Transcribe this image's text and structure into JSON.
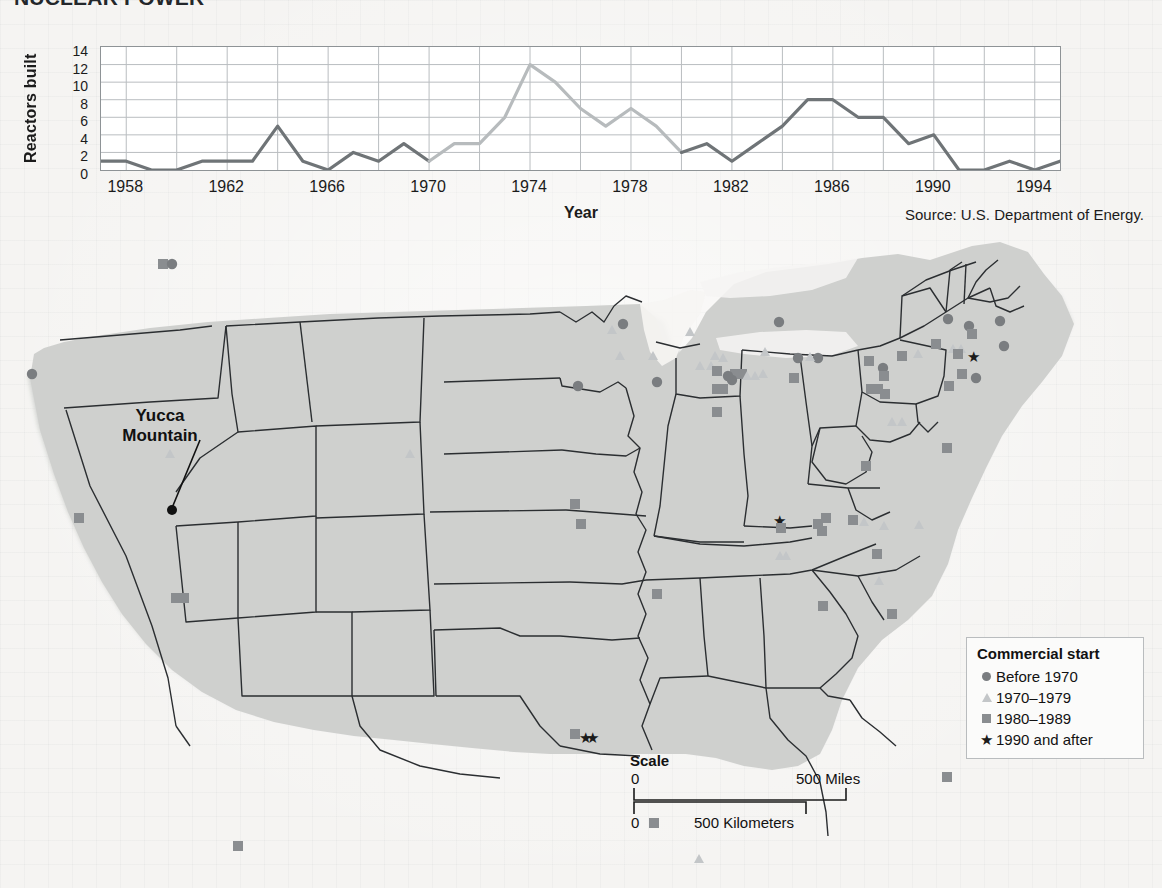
{
  "title": "NUCLEAR POWER",
  "source": "Source: U.S. Department of Energy.",
  "chart_data": {
    "type": "line",
    "xlabel": "Year",
    "ylabel": "Reactors built",
    "ylim": [
      0,
      14
    ],
    "xlim": [
      1957,
      1995
    ],
    "grid": true,
    "legend_position": "none",
    "yticks": [
      14,
      12,
      10,
      8,
      6,
      4,
      2,
      0
    ],
    "xticks": [
      "1958",
      "1962",
      "1966",
      "1970",
      "1974",
      "1978",
      "1982",
      "1986",
      "1990",
      "1994"
    ],
    "x": [
      1957,
      1958,
      1959,
      1960,
      1961,
      1962,
      1963,
      1964,
      1965,
      1966,
      1967,
      1968,
      1969,
      1970,
      1971,
      1972,
      1973,
      1974,
      1975,
      1976,
      1977,
      1978,
      1979,
      1980,
      1981,
      1982,
      1983,
      1984,
      1985,
      1986,
      1987,
      1988,
      1989,
      1990,
      1991,
      1992,
      1993,
      1994,
      1995
    ],
    "values": [
      1,
      1,
      0,
      0,
      1,
      1,
      1,
      5,
      1,
      0,
      2,
      1,
      3,
      1,
      3,
      3,
      6,
      12,
      10,
      7,
      5,
      7,
      5,
      2,
      3,
      1,
      3,
      5,
      8,
      8,
      6,
      6,
      3,
      4,
      0,
      0,
      1,
      0,
      1
    ],
    "series": [
      {
        "name": "Reactors built",
        "color_segments": [
          {
            "from": 1957,
            "to": 1970,
            "color": "#6f7477"
          },
          {
            "from": 1970,
            "to": 1980,
            "color": "#b7bbbd"
          },
          {
            "from": 1980,
            "to": 1995,
            "color": "#6f7477"
          }
        ]
      }
    ]
  },
  "map": {
    "annotation": {
      "label_line1": "Yucca",
      "label_line2": "Mountain"
    },
    "legend": {
      "title": "Commercial start",
      "items": [
        {
          "symbol": "circle-marker",
          "label": "Before 1970",
          "color": "#7a7d80"
        },
        {
          "symbol": "triangle-marker",
          "label": "1970–1979",
          "color": "#c3c6c8"
        },
        {
          "symbol": "square-marker",
          "label": "1980–1989",
          "color": "#8a8d90"
        },
        {
          "symbol": "star-marker",
          "label": "1990 and after",
          "color": "#1b1b1b"
        }
      ]
    },
    "scale": {
      "title": "Scale",
      "miles_zero": "0",
      "miles_max": "500 Miles",
      "km_zero": "0",
      "km_max": "500 Kilometers"
    },
    "colors": {
      "land": "#cfd0ce",
      "border": "#2a2d30",
      "water": "#f3f2f0"
    }
  }
}
